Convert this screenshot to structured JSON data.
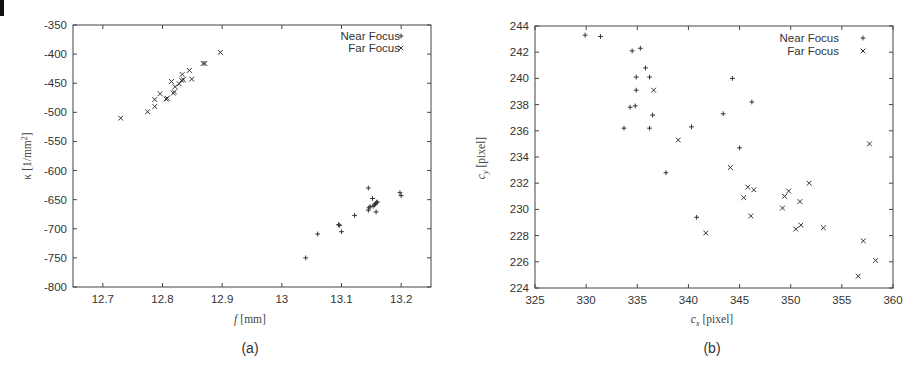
{
  "chart_data": [
    {
      "type": "scatter",
      "panel_label": "(a)",
      "xlabel": "f [mm]",
      "ylabel": "κ [1/mm²]",
      "xlim": [
        12.65,
        13.25
      ],
      "ylim": [
        -800,
        -350
      ],
      "xticks": [
        12.7,
        12.8,
        12.9,
        13,
        13.1,
        13.2
      ],
      "xtick_labels": [
        "12.7",
        "12.8",
        "12.9",
        "13",
        "13.1",
        "13.2"
      ],
      "yticks": [
        -350,
        -400,
        -450,
        -500,
        -550,
        -600,
        -650,
        -700,
        -750,
        -800
      ],
      "ytick_labels": [
        "-350",
        "-400",
        "-450",
        "-500",
        "-550",
        "-600",
        "-650",
        "-700",
        "-750",
        "-800"
      ],
      "grid": false,
      "legend_position": "top-right",
      "series": [
        {
          "name": "Near Focus",
          "marker": "+",
          "points": [
            [
              13.04,
              -750
            ],
            [
              13.06,
              -709
            ],
            [
              13.095,
              -693
            ],
            [
              13.097,
              -694
            ],
            [
              13.1,
              -705
            ],
            [
              13.122,
              -677
            ],
            [
              13.145,
              -630
            ],
            [
              13.145,
              -668
            ],
            [
              13.146,
              -664
            ],
            [
              13.148,
              -662
            ],
            [
              13.152,
              -648
            ],
            [
              13.153,
              -661
            ],
            [
              13.155,
              -659
            ],
            [
              13.157,
              -657
            ],
            [
              13.158,
              -671
            ],
            [
              13.159,
              -655
            ],
            [
              13.16,
              -654
            ],
            [
              13.198,
              -638
            ],
            [
              13.2,
              -643
            ]
          ]
        },
        {
          "name": "Far Focus",
          "marker": "x",
          "points": [
            [
              12.73,
              -510
            ],
            [
              12.775,
              -499
            ],
            [
              12.787,
              -490
            ],
            [
              12.787,
              -478
            ],
            [
              12.796,
              -468
            ],
            [
              12.806,
              -477
            ],
            [
              12.808,
              -476
            ],
            [
              12.815,
              -447
            ],
            [
              12.818,
              -467
            ],
            [
              12.82,
              -465
            ],
            [
              12.821,
              -456
            ],
            [
              12.828,
              -451
            ],
            [
              12.832,
              -445
            ],
            [
              12.833,
              -435
            ],
            [
              12.835,
              -444
            ],
            [
              12.845,
              -428
            ],
            [
              12.849,
              -443
            ],
            [
              12.868,
              -416
            ],
            [
              12.871,
              -416
            ],
            [
              12.897,
              -397
            ]
          ]
        }
      ]
    },
    {
      "type": "scatter",
      "panel_label": "(b)",
      "xlabel": "cx [pixel]",
      "ylabel": "cy [pixel]",
      "xlim": [
        325,
        360
      ],
      "ylim": [
        224,
        244
      ],
      "xticks": [
        325,
        330,
        335,
        340,
        345,
        350,
        355,
        360
      ],
      "xtick_labels": [
        "325",
        "330",
        "335",
        "340",
        "345",
        "350",
        "355",
        "360"
      ],
      "yticks": [
        224,
        226,
        228,
        230,
        232,
        234,
        236,
        238,
        240,
        242,
        244
      ],
      "ytick_labels": [
        "224",
        "226",
        "228",
        "230",
        "232",
        "234",
        "236",
        "238",
        "240",
        "242",
        "244"
      ],
      "grid": false,
      "legend_position": "top-right",
      "series": [
        {
          "name": "Near Focus",
          "marker": "+",
          "points": [
            [
              329.9,
              243.3
            ],
            [
              331.4,
              243.2
            ],
            [
              333.7,
              236.2
            ],
            [
              334.3,
              237.8
            ],
            [
              334.5,
              242.1
            ],
            [
              334.8,
              237.9
            ],
            [
              334.9,
              240.1
            ],
            [
              334.9,
              239.1
            ],
            [
              335.3,
              242.3
            ],
            [
              335.8,
              240.8
            ],
            [
              336.2,
              240.1
            ],
            [
              336.2,
              236.2
            ],
            [
              336.5,
              237.2
            ],
            [
              337.8,
              232.8
            ],
            [
              340.3,
              236.3
            ],
            [
              340.8,
              229.4
            ],
            [
              343.4,
              237.3
            ],
            [
              344.3,
              240.0
            ],
            [
              345.0,
              234.7
            ],
            [
              346.2,
              238.2
            ]
          ]
        },
        {
          "name": "Far Focus",
          "marker": "x",
          "points": [
            [
              336.6,
              239.1
            ],
            [
              339.0,
              235.3
            ],
            [
              341.7,
              228.2
            ],
            [
              344.1,
              233.2
            ],
            [
              345.4,
              230.9
            ],
            [
              345.8,
              231.7
            ],
            [
              346.1,
              229.5
            ],
            [
              346.4,
              231.5
            ],
            [
              349.2,
              230.1
            ],
            [
              349.4,
              231.0
            ],
            [
              349.8,
              231.4
            ],
            [
              350.5,
              228.5
            ],
            [
              350.9,
              230.6
            ],
            [
              351.0,
              228.8
            ],
            [
              351.8,
              232.0
            ],
            [
              353.2,
              228.6
            ],
            [
              356.6,
              224.9
            ],
            [
              357.1,
              227.6
            ],
            [
              357.7,
              235.0
            ],
            [
              358.3,
              226.1
            ]
          ]
        }
      ]
    }
  ],
  "panels": {
    "a": {
      "caption": "(a)",
      "xlabel_var": "f",
      "xlabel_unit": "[mm]",
      "ylabel_var": "κ",
      "ylabel_unit": "[1/mm",
      "ylabel_sup": "2",
      "ylabel_close": "]",
      "legend": [
        "Near Focus",
        "Far Focus"
      ]
    },
    "b": {
      "caption": "(b)",
      "xlabel_var": "c",
      "xlabel_sub": "x",
      "xlabel_unit": "[pixel]",
      "ylabel_var": "c",
      "ylabel_sub": "y",
      "ylabel_unit": "[pixel]",
      "legend": [
        "Near Focus",
        "Far Focus"
      ]
    }
  }
}
